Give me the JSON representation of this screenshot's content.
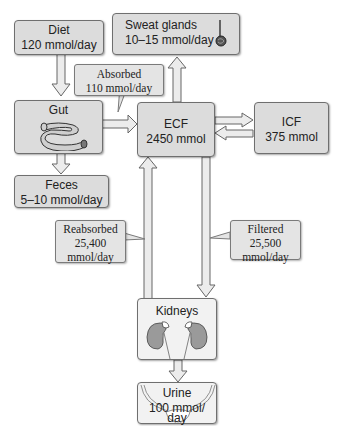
{
  "nodes": {
    "diet": {
      "title": "Diet",
      "value": "120 mmol/day"
    },
    "sweat": {
      "title": "Sweat glands",
      "value": "10–15 mmol/day",
      "icon": "sweat-gland-icon"
    },
    "gut": {
      "title": "Gut",
      "icon": "intestine-icon"
    },
    "ecf": {
      "title": "ECF",
      "value": "2450 mmol"
    },
    "icf": {
      "title": "ICF",
      "value": "375 mmol"
    },
    "feces": {
      "title": "Feces",
      "value": "5–10 mmol/day"
    },
    "kidneys": {
      "title": "Kidneys",
      "icon": "kidneys-icon"
    },
    "urine": {
      "title": "Urine",
      "value_line1": "100 mmol/",
      "value_line2": "day",
      "icon": "bladder-icon"
    }
  },
  "callouts": {
    "absorbed": {
      "label": "Absorbed",
      "value": "110 mmol/day"
    },
    "reabsorbed": {
      "label": "Reabsorbed",
      "value": "25,400",
      "unit": "mmol/day"
    },
    "filtered": {
      "label": "Filtered",
      "value": "25,500",
      "unit": "mmol/day"
    }
  },
  "colors": {
    "box_fill": "#dcdcdc",
    "box_border": "#6f6f6f",
    "arrow_fill": "#e8e8e8",
    "arrow_stroke": "#666666"
  }
}
